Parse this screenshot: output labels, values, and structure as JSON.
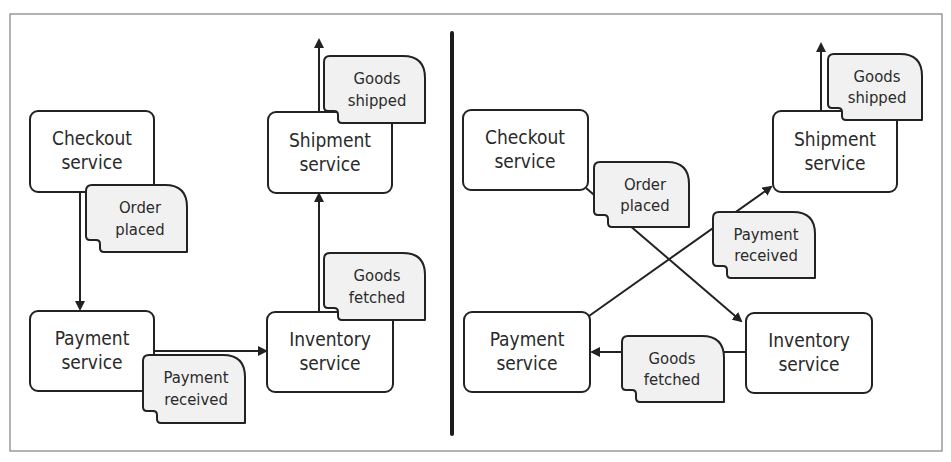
{
  "left_panel": {
    "services": {
      "checkout": {
        "line1": "Checkout",
        "line2": "service"
      },
      "shipment": {
        "line1": "Shipment",
        "line2": "service"
      },
      "payment": {
        "line1": "Payment",
        "line2": "service"
      },
      "inventory": {
        "line1": "Inventory",
        "line2": "service"
      }
    },
    "events": {
      "order_placed": {
        "line1": "Order",
        "line2": "placed"
      },
      "payment_received": {
        "line1": "Payment",
        "line2": "received"
      },
      "goods_fetched": {
        "line1": "Goods",
        "line2": "fetched"
      },
      "goods_shipped": {
        "line1": "Goods",
        "line2": "shipped"
      }
    }
  },
  "right_panel": {
    "services": {
      "checkout": {
        "line1": "Checkout",
        "line2": "service"
      },
      "shipment": {
        "line1": "Shipment",
        "line2": "service"
      },
      "payment": {
        "line1": "Payment",
        "line2": "service"
      },
      "inventory": {
        "line1": "Inventory",
        "line2": "service"
      }
    },
    "events": {
      "order_placed": {
        "line1": "Order",
        "line2": "placed"
      },
      "payment_received": {
        "line1": "Payment",
        "line2": "received"
      },
      "goods_fetched": {
        "line1": "Goods",
        "line2": "fetched"
      },
      "goods_shipped": {
        "line1": "Goods",
        "line2": "shipped"
      }
    }
  },
  "colors": {
    "line": "#222222",
    "event_fill": "#f1f1f1",
    "service_fill": "#ffffff",
    "frame": "#8a8a8a"
  }
}
